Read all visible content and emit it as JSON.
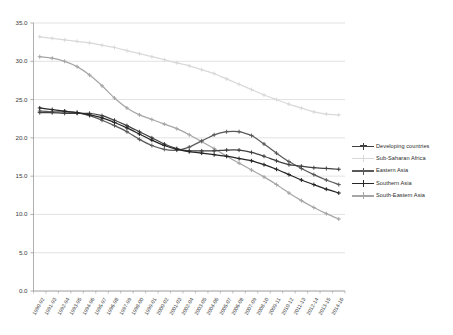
{
  "chart_data": {
    "type": "line",
    "title": "",
    "subtitle": "",
    "xlabel": "",
    "ylabel": "",
    "ylim": [
      0.0,
      35.0
    ],
    "yticks": [
      "0.0",
      "5.0",
      "10.0",
      "15.0",
      "20.0",
      "25.0",
      "30.0",
      "35.0"
    ],
    "ytick_values": [
      0,
      5,
      10,
      15,
      20,
      25,
      30,
      35
    ],
    "grid": true,
    "legend_position": "right",
    "marker": "plus",
    "categories": [
      "1990-92",
      "1991-93",
      "1992-94",
      "1993-95",
      "1994-96",
      "1995-97",
      "1996-98",
      "1997-99",
      "1998-00",
      "1999-01",
      "2000-02",
      "2001-03",
      "2002-04",
      "2003-05",
      "2004-06",
      "2005-07",
      "2006-08",
      "2007-09",
      "2008-10",
      "2009-11",
      "2010-12",
      "2011-13",
      "2012-14",
      "2013-15",
      "2014-16"
    ],
    "series": [
      {
        "name": "Developing countries",
        "color": "#404040",
        "values": [
          23.3,
          23.3,
          23.2,
          23.2,
          23.2,
          22.9,
          22.3,
          21.6,
          20.8,
          20.0,
          19.2,
          18.6,
          18.3,
          18.3,
          18.3,
          18.4,
          18.4,
          18.1,
          17.6,
          17.0,
          16.5,
          16.3,
          16.1,
          16.0,
          15.9
        ]
      },
      {
        "name": "Sub-Saharan Africa",
        "color": "#d9d9d9",
        "values": [
          33.2,
          33.0,
          32.8,
          32.6,
          32.4,
          32.1,
          31.8,
          31.4,
          31.0,
          30.6,
          30.2,
          29.8,
          29.4,
          28.9,
          28.4,
          27.7,
          27.0,
          26.3,
          25.6,
          25.0,
          24.4,
          23.9,
          23.4,
          23.1,
          23.0
        ]
      },
      {
        "name": "Eastern Asia",
        "color": "#595959",
        "values": [
          23.5,
          23.4,
          23.4,
          23.3,
          22.9,
          22.3,
          21.6,
          20.8,
          19.8,
          19.0,
          18.5,
          18.4,
          18.8,
          19.6,
          20.4,
          20.8,
          20.8,
          20.3,
          19.2,
          18.0,
          16.9,
          16.0,
          15.2,
          14.5,
          13.9
        ]
      },
      {
        "name": "Southern Asia",
        "color": "#262626",
        "values": [
          23.9,
          23.7,
          23.5,
          23.3,
          23.0,
          22.6,
          22.0,
          21.3,
          20.5,
          19.7,
          19.0,
          18.5,
          18.2,
          18.0,
          17.8,
          17.6,
          17.3,
          17.0,
          16.5,
          15.9,
          15.2,
          14.5,
          13.9,
          13.3,
          12.8
        ]
      },
      {
        "name": "South-Eastern Asia",
        "color": "#a6a6a6",
        "values": [
          30.6,
          30.4,
          30.0,
          29.3,
          28.2,
          26.8,
          25.2,
          23.9,
          23.0,
          22.4,
          21.8,
          21.2,
          20.4,
          19.5,
          18.6,
          17.6,
          16.7,
          15.8,
          14.9,
          13.9,
          12.8,
          11.8,
          10.9,
          10.1,
          9.4
        ]
      }
    ]
  },
  "legend": {
    "items": [
      {
        "label": "Developing countries",
        "color": "#404040",
        "marker": "plus-marker"
      },
      {
        "label": "Sub-Saharan Africa",
        "color": "#d9d9d9",
        "marker": "plus-marker"
      },
      {
        "label": "Eastern Asia",
        "color": "#595959",
        "marker": "plus-marker"
      },
      {
        "label": "Southern Asia",
        "color": "#262626",
        "marker": "plus-marker"
      },
      {
        "label": "South-Eastern Asia",
        "color": "#a6a6a6",
        "marker": "plus-marker"
      }
    ]
  },
  "axes": {
    "y_tick_labels": [
      "35.0",
      "30.0",
      "25.0",
      "20.0",
      "15.0",
      "10.0",
      "5.0",
      "0.0"
    ],
    "x_tick_labels": [
      "1990-92",
      "1991-93",
      "1992-94",
      "1993-95",
      "1994-96",
      "1995-97",
      "1996-98",
      "1997-99",
      "1998-00",
      "1999-01",
      "2000-02",
      "2001-03",
      "2002-04",
      "2003-05",
      "2004-06",
      "2005-07",
      "2006-08",
      "2007-09",
      "2008-10",
      "2009-11",
      "2010-12",
      "2011-13",
      "2012-14",
      "2013-15",
      "2014-16"
    ]
  },
  "style": {
    "grid_color": "#d6d6d6",
    "axis_color": "#9a9a9a",
    "background": "#ffffff"
  }
}
